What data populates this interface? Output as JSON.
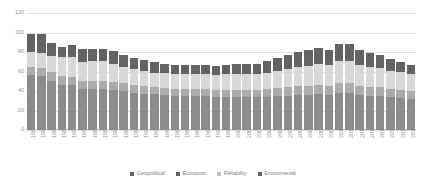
{
  "chart_data": {
    "type": "bar",
    "stacked": true,
    "title": "",
    "xlabel": "",
    "ylabel": "",
    "ylim": [
      0,
      120
    ],
    "yticks": [
      0,
      20,
      40,
      60,
      80,
      100,
      120
    ],
    "grid": true,
    "legend_position": "bottom",
    "categories": [
      "1980",
      "1981",
      "1982",
      "1983",
      "1984",
      "1985",
      "1986",
      "1987",
      "1988",
      "1989",
      "1990",
      "1991",
      "1992",
      "1993",
      "1994",
      "1995",
      "1996",
      "1997",
      "1998",
      "1999",
      "2000",
      "2001",
      "2002",
      "2003",
      "2004",
      "2005",
      "2006",
      "2007",
      "2008",
      "2009",
      "2010",
      "2011",
      "2012",
      "2013",
      "2014",
      "2015",
      "2016",
      "2017"
    ],
    "series": [
      {
        "name": "Geopolitical",
        "color": "#8c8c8c",
        "values": [
          56,
          55,
          50,
          46,
          46,
          42,
          42,
          42,
          41,
          40,
          38,
          37,
          37,
          36,
          35,
          35,
          35,
          35,
          34,
          34,
          34,
          34,
          34,
          34,
          35,
          35,
          36,
          36,
          37,
          36,
          38,
          38,
          36,
          35,
          35,
          34,
          33,
          32
        ]
      },
      {
        "name": "Economic",
        "color": "#ababab",
        "values": [
          9,
          9,
          9,
          9,
          8,
          8,
          8,
          8,
          8,
          8,
          8,
          8,
          7,
          7,
          7,
          7,
          7,
          7,
          7,
          7,
          7,
          7,
          7,
          8,
          8,
          9,
          9,
          9,
          9,
          9,
          10,
          10,
          9,
          9,
          9,
          8,
          8,
          8
        ]
      },
      {
        "name": "Reliability",
        "color": "#d8d8d8",
        "values": [
          15,
          15,
          17,
          20,
          21,
          20,
          21,
          21,
          19,
          17,
          17,
          16,
          15,
          15,
          15,
          15,
          15,
          15,
          15,
          16,
          16,
          16,
          16,
          17,
          18,
          19,
          20,
          21,
          22,
          22,
          23,
          23,
          22,
          21,
          20,
          19,
          18,
          17
        ]
      },
      {
        "name": "Enviromental",
        "color": "#636363",
        "values": [
          19,
          19,
          13,
          10,
          12,
          13,
          12,
          12,
          13,
          12,
          11,
          11,
          11,
          10,
          10,
          10,
          10,
          10,
          10,
          10,
          11,
          11,
          11,
          12,
          13,
          14,
          15,
          16,
          16,
          15,
          17,
          17,
          15,
          14,
          13,
          12,
          11,
          10
        ]
      }
    ],
    "totals": [
      99,
      98,
      89,
      85,
      87,
      83,
      83,
      83,
      81,
      77,
      74,
      72,
      70,
      68,
      67,
      67,
      67,
      67,
      66,
      67,
      68,
      68,
      68,
      71,
      74,
      77,
      80,
      82,
      84,
      82,
      88,
      88,
      82,
      79,
      77,
      73,
      70,
      67
    ]
  },
  "legend": {
    "items": [
      {
        "label": "Geopolitical",
        "color": "#636363"
      },
      {
        "label": "Economic",
        "color": "#636363"
      },
      {
        "label": "Reliability",
        "color": "#bfbfbf"
      },
      {
        "label": "Enviromental",
        "color": "#636363"
      }
    ]
  }
}
